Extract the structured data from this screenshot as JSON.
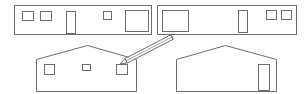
{
  "diagram": {
    "title": "",
    "stroke_color": "#6e6e6e",
    "background": "#ffffff",
    "elevations": [
      {
        "id": "long-side-a",
        "type": "rectangle",
        "outline": {
          "x": 14,
          "y": 5,
          "w": 137,
          "h": 29
        },
        "openings": [
          {
            "kind": "window",
            "x": 22,
            "y": 11,
            "w": 11,
            "h": 9
          },
          {
            "kind": "window",
            "x": 40,
            "y": 11,
            "w": 11,
            "h": 9
          },
          {
            "kind": "door",
            "x": 66,
            "y": 11,
            "w": 9,
            "h": 22
          },
          {
            "kind": "window",
            "x": 103,
            "y": 11,
            "w": 8,
            "h": 8
          },
          {
            "kind": "window-large",
            "x": 125,
            "y": 10,
            "w": 23,
            "h": 21
          }
        ]
      },
      {
        "id": "long-side-b",
        "type": "rectangle",
        "outline": {
          "x": 157,
          "y": 5,
          "w": 139,
          "h": 29
        },
        "openings": [
          {
            "kind": "window-large",
            "x": 162,
            "y": 10,
            "w": 26,
            "h": 21
          },
          {
            "kind": "door",
            "x": 238,
            "y": 10,
            "w": 9,
            "h": 22
          },
          {
            "kind": "window",
            "x": 266,
            "y": 10,
            "w": 10,
            "h": 9
          },
          {
            "kind": "window",
            "x": 281,
            "y": 10,
            "w": 10,
            "h": 9
          }
        ]
      },
      {
        "id": "gable-end-a",
        "type": "gable",
        "outline": {
          "left": 36,
          "right": 136,
          "bottom": 91,
          "eave": 59,
          "peak_x": 87,
          "peak_y": 45
        },
        "openings": [
          {
            "kind": "window",
            "x": 44,
            "y": 64,
            "w": 10,
            "h": 10
          },
          {
            "kind": "window",
            "x": 82,
            "y": 64,
            "w": 8,
            "h": 6
          },
          {
            "kind": "window",
            "x": 116,
            "y": 64,
            "w": 11,
            "h": 10
          }
        ]
      },
      {
        "id": "gable-end-b",
        "type": "gable",
        "outline": {
          "left": 176,
          "right": 276,
          "bottom": 91,
          "eave": 59,
          "peak_x": 225,
          "peak_y": 45
        },
        "openings": [
          {
            "kind": "door",
            "x": 258,
            "y": 64,
            "w": 11,
            "h": 26
          }
        ]
      }
    ],
    "pencil": {
      "tip": {
        "x": 120,
        "y": 64
      },
      "end": {
        "x": 172,
        "y": 37
      },
      "width": 5
    }
  }
}
